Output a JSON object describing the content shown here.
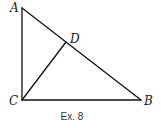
{
  "diagram": {
    "type": "geometry-triangle",
    "caption": "Ex. 8",
    "points": {
      "A": {
        "label": "A",
        "x": 22,
        "y": 8
      },
      "B": {
        "label": "B",
        "x": 141,
        "y": 100
      },
      "C": {
        "label": "C",
        "x": 22,
        "y": 100
      },
      "D": {
        "label": "D",
        "x": 66,
        "y": 42
      }
    },
    "segments": [
      {
        "name": "AC",
        "from": "A",
        "to": "C"
      },
      {
        "name": "CB",
        "from": "C",
        "to": "B"
      },
      {
        "name": "AB",
        "from": "A",
        "to": "B"
      },
      {
        "name": "CD",
        "from": "C",
        "to": "D"
      }
    ],
    "colors": {
      "line": "#111111",
      "label": "#1a1a1a",
      "background": "#ffffff"
    }
  }
}
